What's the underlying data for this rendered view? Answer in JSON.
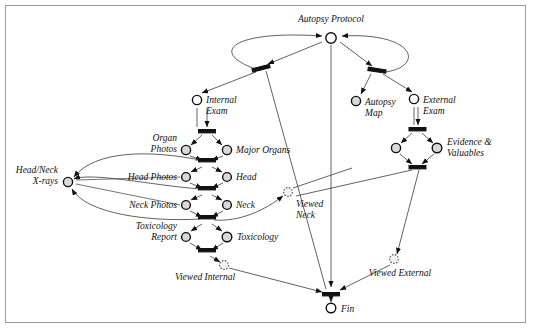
{
  "diagram": {
    "type": "petri-net",
    "frame": {
      "border_color": "#9a9a9a",
      "background": "#ffffff"
    },
    "colors": {
      "edge": "#3a3a3a",
      "place_fill": "#d9d9d9",
      "place_stroke": "#111111",
      "transition_fill": "#111111",
      "viewed_place_stroke": "#555555"
    },
    "places": [
      {
        "id": "autopsy_protocol",
        "label": "Autopsy Protocol",
        "x": 331,
        "y": 38,
        "style": "open",
        "label_pos": "above",
        "label_anchor": "middle",
        "lx": 331,
        "ly": 22
      },
      {
        "id": "internal_exam",
        "label": "Internal Exam",
        "x": 197,
        "y": 100,
        "style": "open",
        "label_pos": "right",
        "label_anchor": "start",
        "lx": 207,
        "ly": 103,
        "lines": [
          "Internal",
          "Exam"
        ]
      },
      {
        "id": "autopsy_map",
        "label": "Autopsy Map",
        "x": 356,
        "y": 101,
        "style": "filled",
        "label_pos": "right",
        "label_anchor": "start",
        "lx": 366,
        "ly": 104,
        "lines": [
          "Autopsy",
          "Map"
        ]
      },
      {
        "id": "external_exam",
        "label": "External Exam",
        "x": 414,
        "y": 99,
        "style": "open",
        "label_pos": "right",
        "label_anchor": "start",
        "lx": 424,
        "ly": 102,
        "lines": [
          "External",
          "Exam"
        ]
      },
      {
        "id": "organ_photos",
        "label": "Organ Photos",
        "x": 187,
        "y": 150,
        "style": "filled",
        "label_pos": "left",
        "label_anchor": "end",
        "lx": 177,
        "ly": 141,
        "lines": [
          "Organ",
          "Photos"
        ]
      },
      {
        "id": "major_organs",
        "label": "Major Organs",
        "x": 226,
        "y": 150,
        "style": "filled",
        "label_pos": "right",
        "label_anchor": "start",
        "lx": 236,
        "ly": 153,
        "lines": [
          "Major Organs"
        ]
      },
      {
        "id": "head_photos",
        "label": "Head Photos",
        "x": 187,
        "y": 177,
        "style": "filled",
        "label_pos": "left",
        "label_anchor": "end",
        "lx": 177,
        "ly": 180,
        "lines": [
          "Head Photos"
        ]
      },
      {
        "id": "head",
        "label": "Head",
        "x": 226,
        "y": 177,
        "style": "filled",
        "label_pos": "right",
        "label_anchor": "start",
        "lx": 236,
        "ly": 180,
        "lines": [
          "Head"
        ]
      },
      {
        "id": "neck_photos",
        "label": "Neck Photos",
        "x": 187,
        "y": 205,
        "style": "filled",
        "label_pos": "left",
        "label_anchor": "end",
        "lx": 177,
        "ly": 208,
        "lines": [
          "Neck Photos"
        ]
      },
      {
        "id": "neck",
        "label": "Neck",
        "x": 226,
        "y": 205,
        "style": "filled",
        "label_pos": "right",
        "label_anchor": "start",
        "lx": 236,
        "ly": 208,
        "lines": [
          "Neck"
        ]
      },
      {
        "id": "toxicology_report",
        "label": "Toxicology Report",
        "x": 187,
        "y": 237,
        "style": "filled",
        "label_pos": "left",
        "label_anchor": "end",
        "lx": 177,
        "ly": 228,
        "lines": [
          "Toxicology",
          "Report"
        ]
      },
      {
        "id": "toxicology",
        "label": "Toxicology",
        "x": 226,
        "y": 237,
        "style": "filled",
        "label_pos": "right",
        "label_anchor": "start",
        "lx": 236,
        "ly": 240,
        "lines": [
          "Toxicology"
        ]
      },
      {
        "id": "head_neck_xrays",
        "label": "Head/Neck X-rays",
        "x": 68,
        "y": 182,
        "style": "filled",
        "label_pos": "left",
        "label_anchor": "end",
        "lx": 58,
        "ly": 173,
        "lines": [
          "Head/Neck",
          "X-rays"
        ]
      },
      {
        "id": "evidence_valuables",
        "label": "Evidence & Valuables",
        "x": 437,
        "y": 148,
        "style": "filled",
        "label_pos": "right",
        "label_anchor": "start",
        "lx": 447,
        "ly": 143,
        "lines": [
          "Evidence &",
          "Valuables"
        ]
      },
      {
        "id": "evidence_left",
        "label": "",
        "x": 397,
        "y": 148,
        "style": "filled",
        "label_pos": "none",
        "label_anchor": "start",
        "lx": 0,
        "ly": 0,
        "lines": []
      },
      {
        "id": "viewed_neck",
        "label": "Viewed Neck",
        "x": 288,
        "y": 192,
        "style": "dotted",
        "label_pos": "below",
        "label_anchor": "start",
        "lx": 294,
        "ly": 205,
        "lines": [
          "Viewed",
          "Neck"
        ]
      },
      {
        "id": "viewed_internal",
        "label": "Viewed Internal",
        "x": 224,
        "y": 265,
        "style": "dotted",
        "label_pos": "left",
        "label_anchor": "end",
        "lx": 216,
        "ly": 277,
        "lines": [
          "Viewed Internal"
        ]
      },
      {
        "id": "viewed_external",
        "label": "Viewed External",
        "x": 394,
        "y": 260,
        "style": "dotted",
        "label_pos": "below",
        "label_anchor": "middle",
        "lx": 400,
        "ly": 277,
        "lines": [
          "Viewed External"
        ]
      },
      {
        "id": "fin",
        "label": "Fin",
        "x": 331,
        "y": 308,
        "style": "open",
        "label_pos": "right",
        "label_anchor": "start",
        "lx": 341,
        "ly": 311,
        "lines": [
          "Fin"
        ]
      }
    ],
    "transitions": [
      {
        "id": "t_split_left",
        "x": 261,
        "y": 68,
        "w": 18,
        "h": 3.2,
        "rot": -14
      },
      {
        "id": "t_split_right",
        "x": 377,
        "y": 70,
        "w": 18,
        "h": 3.2,
        "rot": 8
      },
      {
        "id": "t_internal_start",
        "x": 207,
        "y": 131,
        "w": 17,
        "h": 3.2,
        "rot": 0
      },
      {
        "id": "t_organ_done",
        "x": 207,
        "y": 163,
        "w": 17,
        "h": 3.2,
        "rot": 0
      },
      {
        "id": "t_head_done",
        "x": 207,
        "y": 191,
        "w": 17,
        "h": 3.2,
        "rot": 0
      },
      {
        "id": "t_neck_done",
        "x": 207,
        "y": 220,
        "w": 17,
        "h": 3.2,
        "rot": 0
      },
      {
        "id": "t_tox_done",
        "x": 207,
        "y": 253,
        "w": 17,
        "h": 3.2,
        "rot": 0
      },
      {
        "id": "t_external_start",
        "x": 417,
        "y": 129,
        "w": 17,
        "h": 3.2,
        "rot": 0
      },
      {
        "id": "t_external_done",
        "x": 417,
        "y": 167,
        "w": 17,
        "h": 3.2,
        "rot": 0
      },
      {
        "id": "t_fin",
        "x": 331,
        "y": 294,
        "w": 17,
        "h": 3.2,
        "rot": 0
      }
    ],
    "labels": {
      "autopsy_protocol": "Autopsy Protocol",
      "internal_exam_1": "Internal",
      "internal_exam_2": "Exam",
      "autopsy_map_1": "Autopsy",
      "autopsy_map_2": "Map",
      "external_exam_1": "External",
      "external_exam_2": "Exam",
      "organ_photos_1": "Organ",
      "organ_photos_2": "Photos",
      "major_organs": "Major Organs",
      "head_photos": "Head Photos",
      "head": "Head",
      "neck_photos": "Neck Photos",
      "neck": "Neck",
      "toxicology_report_1": "Toxicology",
      "toxicology_report_2": "Report",
      "toxicology": "Toxicology",
      "head_neck_xrays_1": "Head/Neck",
      "head_neck_xrays_2": "X-rays",
      "evidence_1": "Evidence &",
      "evidence_2": "Valuables",
      "viewed_neck_1": "Viewed",
      "viewed_neck_2": "Neck",
      "viewed_internal": "Viewed Internal",
      "viewed_external": "Viewed External",
      "fin": "Fin"
    }
  }
}
